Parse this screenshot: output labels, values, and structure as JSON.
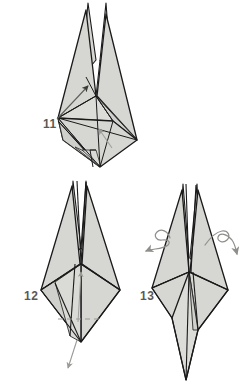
{
  "document": {
    "kind": "origami-instruction-diagram",
    "page_background": "#ffffff"
  },
  "palette": {
    "paper_fill": "#d6d6d3",
    "paper_fill_light": "#e3e3e0",
    "paper_fill_dark": "#c2c2bf",
    "fold_line": "#1a1a1a",
    "thin_line": "#4a4a48",
    "label_color": "#5a5a55",
    "arrow_solid": "#3a3a38",
    "arrow_faint": "#9a9a96",
    "dashed_line": "#9a9a96"
  },
  "steps": [
    {
      "number": "11",
      "label_position": {
        "x": 43,
        "y": 118
      },
      "arrows": [
        {
          "name": "fold-arrow-up-right",
          "style": "solid",
          "direction": "up-right"
        },
        {
          "name": "fold-arrow-up-left",
          "style": "faint",
          "direction": "up-left"
        }
      ]
    },
    {
      "number": "12",
      "label_position": {
        "x": 24,
        "y": 290
      },
      "arrows": [
        {
          "name": "fold-arrow-up",
          "style": "faint",
          "direction": "up"
        },
        {
          "name": "pull-arrow-down",
          "style": "faint",
          "direction": "down"
        }
      ],
      "guides": [
        {
          "name": "dashed-fold-guide",
          "style": "dashed",
          "orientation": "horizontal"
        }
      ]
    },
    {
      "number": "13",
      "label_position": {
        "x": 140,
        "y": 290
      },
      "arrows": [
        {
          "name": "curl-pull-arrow-left",
          "style": "curly",
          "direction": "out-left"
        },
        {
          "name": "curl-pull-arrow-right",
          "style": "curly",
          "direction": "out-right"
        }
      ]
    }
  ]
}
